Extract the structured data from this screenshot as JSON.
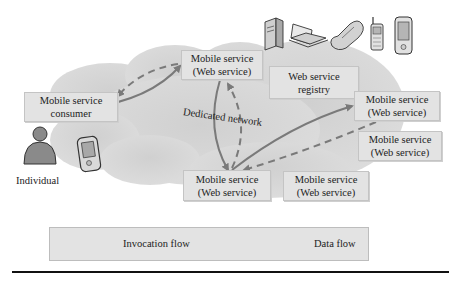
{
  "diagram": {
    "cloud_label": "Dedicated network",
    "nodes": {
      "consumer": {
        "line1": "Mobile service",
        "line2": "consumer"
      },
      "service_top": {
        "line1": "Mobile service",
        "line2": "(Web service)"
      },
      "registry": {
        "line1": "Web service",
        "line2": "registry"
      },
      "service_right1": {
        "line1": "Mobile service",
        "line2": "(Web service)"
      },
      "service_right2": {
        "line1": "Mobile service",
        "line2": "(Web service)"
      },
      "service_bottom": {
        "line1": "Mobile service",
        "line2": "(Web service)"
      },
      "service_bottom2": {
        "line1": "Mobile service",
        "line2": "(Web service)"
      }
    },
    "individual_label": "Individual",
    "devices": [
      "server-icon",
      "laptop-icon",
      "flip-phone-icon",
      "cell-phone-icon",
      "pda-icon"
    ],
    "edges": [
      {
        "from": "consumer",
        "to": "service_top",
        "type": "invocation"
      },
      {
        "from": "service_top",
        "to": "consumer",
        "type": "data"
      },
      {
        "from": "service_top",
        "to": "service_bottom",
        "type": "invocation"
      },
      {
        "from": "service_bottom",
        "to": "service_top",
        "type": "data"
      },
      {
        "from": "service_bottom",
        "to": "service_right1",
        "type": "invocation"
      },
      {
        "from": "service_right1",
        "to": "service_bottom",
        "type": "data"
      }
    ],
    "colors": {
      "cloud": "#d6d6d6",
      "box_fill": "#e3e3e3",
      "arrow": "#7a7a7a"
    }
  },
  "legend": {
    "invocation_label": "Invocation flow",
    "data_label": "Data flow"
  }
}
